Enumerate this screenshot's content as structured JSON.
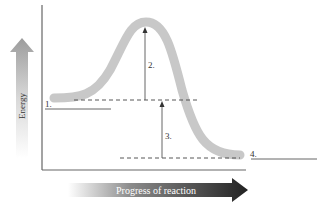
{
  "diagram": {
    "type": "energy-profile",
    "y_axis_label": "Energy",
    "x_axis_label": "Progress of reaction",
    "labels": {
      "reactants": "1.",
      "activation_energy": "2.",
      "energy_change": "3.",
      "products": "4."
    },
    "colors": {
      "curve": "#c8c8c8",
      "axis": "#555555",
      "dashed": "#444444",
      "x_arrow_dark": "#2a2a2a",
      "y_arrow_gray": "#a0a0a0"
    }
  }
}
